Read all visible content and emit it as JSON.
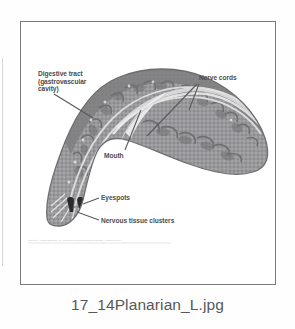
{
  "figure": {
    "title_caption": "17_14Planarian_L.jpg",
    "credit_line": "Copyright © Pearson Education, Inc., publishing as Pearson Benjamin Cummings. All rights reserved.",
    "labels": {
      "digestive_tract": "Digestive tract\n(gastrovascular\ncavity)",
      "nerve_cords": "Nerve cords",
      "mouth": "Mouth",
      "eyespots": "Eyespots",
      "nervous_tissue_clusters": "Nervous tissue clusters"
    },
    "colors": {
      "frame_border": "#77797c",
      "page_background": "#fefefe",
      "figure_background": "#ffffff",
      "body_fill": "#9a9a9c",
      "body_outline": "#6e6e70",
      "gut_dark": "#6d6d70",
      "nerve_light": "#e8e8e8",
      "label_text": "#4c4c4e",
      "caption_text": "#58585a",
      "eyespot": "#2b2b2d",
      "leader_line": "#5a5a5c"
    }
  }
}
